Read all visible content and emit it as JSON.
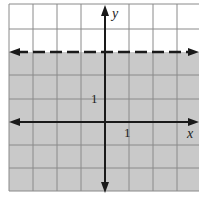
{
  "graph": {
    "type": "inequality-graph",
    "inequality": "y > 3",
    "boundary": {
      "equation": "y = 3",
      "style": "dashed"
    },
    "shaded_region": "above boundary",
    "axes": {
      "x_label": "x",
      "y_label": "y",
      "x_tick_label": "1",
      "y_tick_label": "1"
    },
    "grid": {
      "x_range": [
        -4,
        4
      ],
      "y_range": [
        -3,
        5
      ],
      "step": 1
    },
    "colors": {
      "shade": "#c9c9c9",
      "grid": "#8a8a8a",
      "axis": "#1a1a1a",
      "boundary": "#1a1a1a"
    }
  }
}
